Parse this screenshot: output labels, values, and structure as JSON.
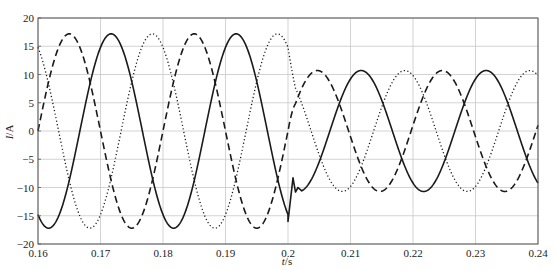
{
  "chart_data": {
    "type": "line",
    "title": "",
    "xlabel": "t/s",
    "ylabel": "I/A",
    "xlim": [
      0.16,
      0.24
    ],
    "ylim": [
      -20,
      20
    ],
    "x_ticks": [
      "0.16",
      "0.17",
      "0.18",
      "0.19",
      "0.2",
      "0.21",
      "0.22",
      "0.23",
      "0.24"
    ],
    "y_ticks": [
      "20",
      "15",
      "10",
      "5",
      "0",
      "-5",
      "-10",
      "-15",
      "-20"
    ],
    "grid": true,
    "legend": null,
    "annotations": [],
    "event": {
      "t": 0.2,
      "description": "step change in three-phase current amplitude"
    },
    "segments": [
      {
        "t_start": 0.16,
        "t_end": 0.2,
        "frequency_hz": 50,
        "amplitude": 17.2
      },
      {
        "t_start": 0.2,
        "t_end": 0.24,
        "frequency_hz": 50,
        "amplitude": 10.7
      }
    ],
    "series": [
      {
        "name": "phase-solid",
        "style": "solid",
        "color": "#1a1a1a",
        "before": {
          "amplitude": 17.2,
          "peak_time": 0.1717
        },
        "after": {
          "amplitude": 10.7,
          "peak_time": 0.2117
        },
        "transient": [
          [
            0.2,
            -16.0
          ],
          [
            0.2008,
            -8.3
          ],
          [
            0.2012,
            -10.8
          ],
          [
            0.2016,
            -10.0
          ],
          [
            0.2022,
            -10.6
          ]
        ],
        "key_points": [
          [
            0.16,
            -14.8
          ],
          [
            0.1617,
            -17.2
          ],
          [
            0.1717,
            17.2
          ],
          [
            0.1817,
            -17.2
          ],
          [
            0.1917,
            17.2
          ],
          [
            0.2,
            -16.0
          ],
          [
            0.2117,
            10.7
          ],
          [
            0.2217,
            -10.7
          ],
          [
            0.2317,
            10.7
          ],
          [
            0.24,
            -9.5
          ]
        ]
      },
      {
        "name": "phase-dashed",
        "style": "dashed",
        "color": "#1a1a1a",
        "before": {
          "amplitude": 17.2,
          "peak_time": 0.165
        },
        "after": {
          "amplitude": 10.7,
          "peak_time": 0.2047
        },
        "key_points": [
          [
            0.16,
            0.0
          ],
          [
            0.165,
            17.2
          ],
          [
            0.175,
            -17.2
          ],
          [
            0.185,
            17.2
          ],
          [
            0.195,
            -17.2
          ],
          [
            0.2,
            -2.0
          ],
          [
            0.2047,
            10.7
          ],
          [
            0.2147,
            -10.7
          ],
          [
            0.2247,
            10.7
          ],
          [
            0.2347,
            -10.7
          ],
          [
            0.24,
            2.0
          ]
        ]
      },
      {
        "name": "phase-dotted",
        "style": "dotted",
        "color": "#1a1a1a",
        "before": {
          "amplitude": 17.2,
          "peak_time": 0.1783
        },
        "after": {
          "amplitude": 10.7,
          "peak_time": 0.2187
        },
        "key_points": [
          [
            0.16,
            15.0
          ],
          [
            0.1683,
            -17.2
          ],
          [
            0.1783,
            17.2
          ],
          [
            0.1883,
            -17.2
          ],
          [
            0.1983,
            17.2
          ],
          [
            0.2,
            15.5
          ],
          [
            0.2087,
            -10.7
          ],
          [
            0.2187,
            10.7
          ],
          [
            0.2287,
            -10.7
          ],
          [
            0.2387,
            10.7
          ],
          [
            0.24,
            10.5
          ]
        ]
      }
    ]
  },
  "layout": {
    "plot": {
      "left": 38,
      "right": 538,
      "top": 18,
      "bottom": 244
    },
    "grid_color": "#c8c8c8",
    "axis_color": "#555555"
  }
}
